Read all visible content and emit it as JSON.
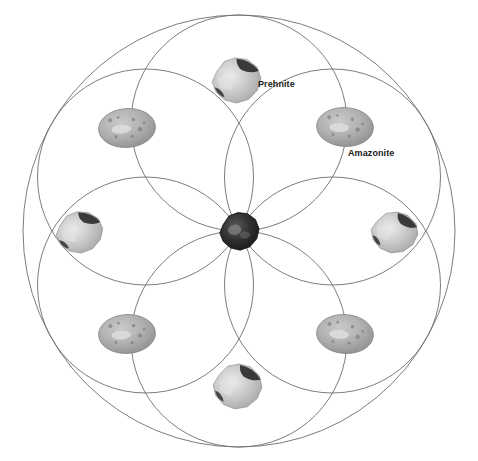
{
  "diagram": {
    "type": "crystal-grid",
    "canvas": {
      "width": 478,
      "height": 461,
      "background": "#ffffff"
    },
    "geometry": {
      "center": {
        "x": 239,
        "y": 231
      },
      "petal_circle_radius": 108,
      "petal_circle_count": 6,
      "petal_circle_centers": [
        {
          "x": 239,
          "y": 123
        },
        {
          "x": 332.5,
          "y": 177
        },
        {
          "x": 332.5,
          "y": 285
        },
        {
          "x": 239,
          "y": 339
        },
        {
          "x": 145.5,
          "y": 285
        },
        {
          "x": 145.5,
          "y": 177
        }
      ],
      "outer_circle_radius": 216,
      "stroke_color": "#6e6e6e",
      "stroke_width": 0.9
    },
    "stones": [
      {
        "id": "center-stone",
        "name": "center-stone",
        "kind": "dark-tumbled-stone",
        "x": 239,
        "y": 231,
        "width": 42,
        "height": 40,
        "rotation": -6,
        "base_color": "#2b2b2b",
        "accent_color": "#555555"
      },
      {
        "id": "top-stone",
        "name": "top-stone",
        "kind": "rough-quartz-chunk",
        "x": 236,
        "y": 80,
        "width": 52,
        "height": 48,
        "rotation": -4,
        "base_color": "#cfcfcf",
        "accent_color": "#2e2e2e"
      },
      {
        "id": "upper-left-stone",
        "name": "upper-left-stone",
        "kind": "polished-oval",
        "x": 127,
        "y": 128,
        "width": 58,
        "height": 40,
        "rotation": -4,
        "base_color": "#b7b7b7",
        "accent_color": "#8f8f8f"
      },
      {
        "id": "upper-right-stone",
        "name": "upper-right-stone",
        "kind": "polished-oval",
        "x": 345,
        "y": 127,
        "width": 58,
        "height": 40,
        "rotation": 3,
        "base_color": "#b7b7b7",
        "accent_color": "#8f8f8f"
      },
      {
        "id": "left-stone",
        "name": "left-stone",
        "kind": "rough-quartz-chunk",
        "x": 79,
        "y": 232,
        "width": 50,
        "height": 44,
        "rotation": -8,
        "base_color": "#cfcfcf",
        "accent_color": "#2e2e2e"
      },
      {
        "id": "right-stone",
        "name": "right-stone",
        "kind": "rough-quartz-chunk",
        "x": 394,
        "y": 232,
        "width": 50,
        "height": 44,
        "rotation": 6,
        "base_color": "#cfcfcf",
        "accent_color": "#2e2e2e"
      },
      {
        "id": "lower-left-stone",
        "name": "lower-left-stone",
        "kind": "polished-oval",
        "x": 127,
        "y": 334,
        "width": 58,
        "height": 40,
        "rotation": -3,
        "base_color": "#b7b7b7",
        "accent_color": "#8f8f8f"
      },
      {
        "id": "lower-right-stone",
        "name": "lower-right-stone",
        "kind": "polished-oval",
        "x": 345,
        "y": 334,
        "width": 58,
        "height": 40,
        "rotation": 4,
        "base_color": "#b7b7b7",
        "accent_color": "#8f8f8f"
      },
      {
        "id": "bottom-stone",
        "name": "bottom-stone",
        "kind": "rough-quartz-chunk",
        "x": 237,
        "y": 386,
        "width": 52,
        "height": 48,
        "rotation": 3,
        "base_color": "#cfcfcf",
        "accent_color": "#2e2e2e"
      }
    ],
    "labels": [
      {
        "id": "label-prehnite",
        "text": "Prehnite",
        "x": 258,
        "y": 84,
        "for": "top-stone"
      },
      {
        "id": "label-amazonite",
        "text": "Amazonite",
        "x": 348,
        "y": 153,
        "for": "upper-right-stone"
      }
    ]
  }
}
